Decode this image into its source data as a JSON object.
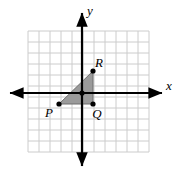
{
  "figure": {
    "kind": "coordinate-plane-geometry",
    "width": 176,
    "height": 171,
    "background_color": "#ffffff"
  },
  "grid": {
    "visible": true,
    "line_color": "#cccccc",
    "spacing_px": 11,
    "x_start_px": 28,
    "x_end_px": 149,
    "y_start_px": 31,
    "y_end_px": 152,
    "columns": 12,
    "rows": 12
  },
  "axes": {
    "color": "#000000",
    "origin_px": {
      "x": 82,
      "y": 93
    },
    "x_axis": {
      "label": "x",
      "label_position": "right",
      "start_px": 10,
      "end_px": 162,
      "arrow_start": true,
      "arrow_end": true
    },
    "y_axis": {
      "label": "y",
      "label_position": "top",
      "start_px": 13,
      "end_px": 166,
      "arrow_start": true,
      "arrow_end": true
    }
  },
  "shape": {
    "name": "triangle PQR",
    "fill_color": "#9a9a9a",
    "stroke_color": "#6f6f6f",
    "vertices": [
      {
        "label": "P",
        "px": {
          "x": 59,
          "y": 104
        },
        "grid": {
          "x": -2,
          "y": -1
        },
        "label_offset": {
          "dx": -10,
          "dy": 13
        },
        "marker": true
      },
      {
        "label": "Q",
        "px": {
          "x": 93,
          "y": 104
        },
        "grid": {
          "x": 1,
          "y": -1
        },
        "label_offset": {
          "dx": 4,
          "dy": 14
        },
        "marker": true
      },
      {
        "label": "R",
        "px": {
          "x": 93,
          "y": 71
        },
        "grid": {
          "x": 1,
          "y": 2
        },
        "label_offset": {
          "dx": 6,
          "dy": -4
        },
        "marker": true
      }
    ],
    "marker_color": "#000000",
    "marker_radius": 2.6
  },
  "origin_marker": {
    "visible": true,
    "color": "#000000",
    "radius": 2.6
  }
}
